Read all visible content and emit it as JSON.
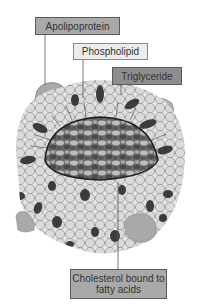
{
  "diagram": {
    "labels": {
      "apolipoprotein": "Apolipoprotein",
      "phospholipid": "Phospholipid",
      "triglyceride": "Triglyceride",
      "cholesterol": "Cholesterol bound to fatty acids"
    },
    "colors": {
      "apolipoprotein": "#a9a9a9",
      "phospholipid_head": "#e4e4e4",
      "triglyceride_box": "#8e8e8e",
      "core_dark": "#4a4a4a",
      "core_light": "#b5b5b5",
      "cholesterol_shell": "#3c3c3c"
    }
  }
}
